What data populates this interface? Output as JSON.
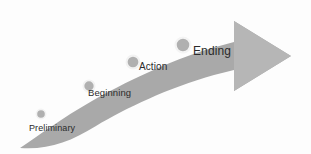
{
  "diagram": {
    "type": "process-arrow",
    "background_color": "#fdfdfd",
    "arrow": {
      "band_color": "#a9a9a9",
      "head_color": "#b6b6b6",
      "direction": "left-to-right-ascending"
    },
    "marker": {
      "ring_color": "#f2f2f2",
      "fill_color": "#b0b0b0"
    },
    "text_color": "#2b2b2b",
    "stages": [
      {
        "id": "preliminary",
        "label": "Preliminary",
        "order": 1,
        "marker_x": 41,
        "marker_y": 114,
        "marker_r": 4.6,
        "label_x": 29,
        "label_y": 124,
        "font_size": 9
      },
      {
        "id": "beginning",
        "label": "Beginning",
        "order": 2,
        "marker_x": 89,
        "marker_y": 86,
        "marker_r": 5.6,
        "label_x": 88,
        "label_y": 88,
        "font_size": 9.5
      },
      {
        "id": "action",
        "label": "Action",
        "order": 3,
        "marker_x": 133,
        "marker_y": 62,
        "marker_r": 6.4,
        "label_x": 139,
        "label_y": 62,
        "font_size": 10
      },
      {
        "id": "ending",
        "label": "Ending",
        "order": 4,
        "marker_x": 183,
        "marker_y": 45,
        "marker_r": 7.4,
        "label_x": 193,
        "label_y": 45,
        "font_size": 12
      }
    ]
  }
}
